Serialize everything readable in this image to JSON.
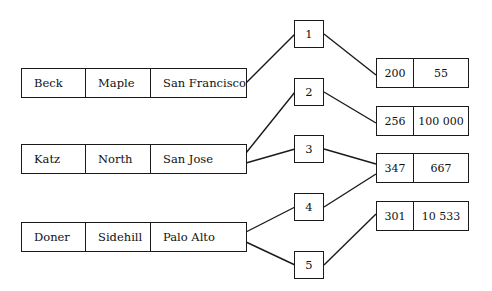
{
  "diagram": {
    "left_records": [
      {
        "name": "Beck",
        "street": "Maple",
        "city": "San Francisco"
      },
      {
        "name": "Katz",
        "street": "North",
        "city": "San Jose"
      },
      {
        "name": "Doner",
        "street": "Sidehill",
        "city": "Palo Alto"
      }
    ],
    "link_nodes": [
      "1",
      "2",
      "3",
      "4",
      "5"
    ],
    "right_records": [
      {
        "id": "200",
        "value": "55"
      },
      {
        "id": "256",
        "value": "100 000"
      },
      {
        "id": "347",
        "value": "667"
      },
      {
        "id": "301",
        "value": "10 533"
      }
    ],
    "connections": [
      {
        "from": "Beck",
        "via": "1",
        "to": "200"
      },
      {
        "from": "Katz",
        "via": "2",
        "to": "256"
      },
      {
        "from": "Katz",
        "via": "3",
        "to": "347"
      },
      {
        "from": "Doner",
        "via": "4",
        "to": "347"
      },
      {
        "from": "Doner",
        "via": "5",
        "to": "301"
      }
    ]
  }
}
